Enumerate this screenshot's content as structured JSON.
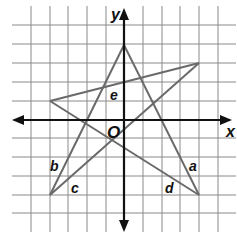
{
  "figure": {
    "type": "coordinate-grid-star",
    "grid": {
      "origin_px": [
        124,
        120
      ],
      "unit_px": 18.7,
      "x_range": [
        -5,
        5
      ],
      "y_range": [
        -5,
        5
      ],
      "line_color": "#8a8a8a"
    },
    "axes": {
      "x_label": "x",
      "y_label": "y",
      "origin_label": "O",
      "color": "#111111"
    },
    "vertices": {
      "top": [
        0,
        4
      ],
      "right": [
        4,
        3
      ],
      "left": [
        -4,
        1
      ],
      "bottom_left": [
        -4,
        -4
      ],
      "bottom_right": [
        4,
        -4
      ]
    },
    "edges": [
      {
        "from": "top",
        "to": "bottom_right",
        "label": "a"
      },
      {
        "from": "top",
        "to": "bottom_left",
        "label": "b"
      },
      {
        "from": "right",
        "to": "bottom_left",
        "label": "c"
      },
      {
        "from": "left",
        "to": "bottom_right",
        "label": "d"
      },
      {
        "from": "left",
        "to": "right",
        "label": "e"
      }
    ],
    "edge_color": "#6a6a6a",
    "labels": {
      "a": "a",
      "b": "b",
      "c": "c",
      "d": "d",
      "e": "e"
    }
  }
}
